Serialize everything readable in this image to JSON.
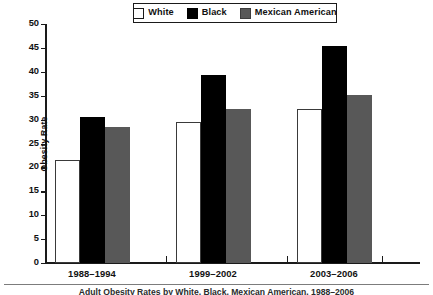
{
  "chart_data": {
    "type": "bar",
    "title": "",
    "xlabel": "",
    "ylabel": "Obesity Rate",
    "ylim": [
      0,
      50
    ],
    "yticks": [
      0,
      5,
      10,
      15,
      20,
      25,
      30,
      35,
      40,
      45,
      50
    ],
    "grid": false,
    "legend_position": "top-center",
    "categories": [
      "1988–1994",
      "1999–2002",
      "2003–2006"
    ],
    "series": [
      {
        "name": "White",
        "color": "#ffffff",
        "values": [
          21.5,
          29.5,
          32.3
        ]
      },
      {
        "name": "Black",
        "color": "#000000",
        "values": [
          30.5,
          39.3,
          45.3
        ]
      },
      {
        "name": "Mexican American",
        "color": "#585858",
        "values": [
          28.5,
          32.2,
          35.2
        ]
      }
    ]
  },
  "legend": {
    "items": [
      {
        "label": "White",
        "swatch": "swatch-white"
      },
      {
        "label": "Black",
        "swatch": "swatch-black"
      },
      {
        "label": "Mexican American",
        "swatch": "swatch-gray"
      }
    ]
  },
  "axes": {
    "y_title": "Obesity Rate",
    "y_ticks": [
      "50",
      "45",
      "40",
      "35",
      "30",
      "25",
      "20",
      "15",
      "10",
      "5",
      "0"
    ],
    "x_labels": [
      "1988–1994",
      "1999–2002",
      "2003–2006"
    ]
  },
  "caption": {
    "text": "Adult Obesity Rates by White, Black, Mexican American, 1988–2006"
  }
}
